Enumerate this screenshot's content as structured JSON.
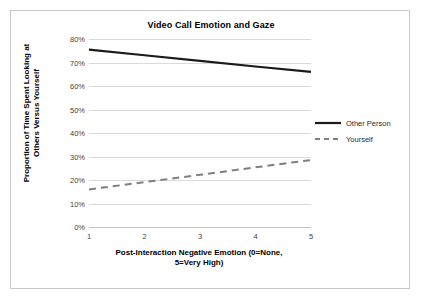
{
  "chart_data": {
    "type": "line",
    "title": "Video Call Emotion and Gaze",
    "xlabel_line1": "Post-Interaction Negative Emotion (0=None,",
    "xlabel_line2": "5=Very High)",
    "ylabel_line1": "Proportion of Time Spent Looking at",
    "ylabel_line2": "Others Versus Yourself",
    "x": [
      1,
      2,
      3,
      4,
      5
    ],
    "xtick_labels": [
      "1",
      "2",
      "3",
      "4",
      "5"
    ],
    "ytick_labels": [
      "0%",
      "10%",
      "20%",
      "30%",
      "40%",
      "50%",
      "60%",
      "70%",
      "80%"
    ],
    "ytick_values": [
      0,
      10,
      20,
      30,
      40,
      50,
      60,
      70,
      80
    ],
    "ylim": [
      0,
      80
    ],
    "xlim": [
      1,
      5
    ],
    "grid": "horizontal",
    "legend_position": "right",
    "series": [
      {
        "name": "Other Person",
        "values": [
          75.5,
          73.1,
          70.7,
          68.3,
          66.0
        ],
        "style": "solid",
        "color": "#1a1a1a",
        "width": 2.2
      },
      {
        "name": "Yourself",
        "values": [
          16.0,
          19.1,
          22.2,
          25.4,
          28.5
        ],
        "style": "dashed",
        "color": "#7f7f7f",
        "width": 2.0
      }
    ]
  },
  "legend": {
    "items": [
      {
        "label": "Other Person"
      },
      {
        "label": "Yourself"
      }
    ]
  },
  "colors": {
    "series_other_person": "#1a1a1a",
    "series_yourself": "#7f7f7f",
    "gridline": "#d9d9d9",
    "frame_border": "#c9c9c9",
    "tick_text": "#3f3f3f",
    "title_text": "#000000",
    "background": "#ffffff"
  }
}
